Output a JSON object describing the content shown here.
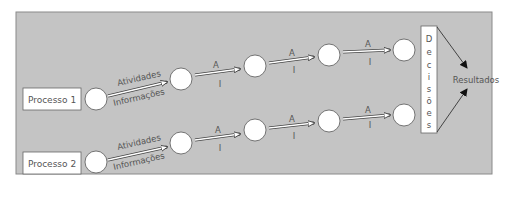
{
  "diagram": {
    "background_color": "#c4c4c4",
    "processes": [
      {
        "label": "Processo 1"
      },
      {
        "label": "Processo 2"
      }
    ],
    "first_arrow": {
      "top_label": "Atividades",
      "bottom_label": "Informações"
    },
    "short_arrow": {
      "top_label": "A",
      "bottom_label": "I"
    },
    "decisions_letters": [
      "D",
      "e",
      "c",
      "i",
      "s",
      "õ",
      "e",
      "s"
    ],
    "decisions_label": "Decisões",
    "results_label": "Resultados"
  }
}
